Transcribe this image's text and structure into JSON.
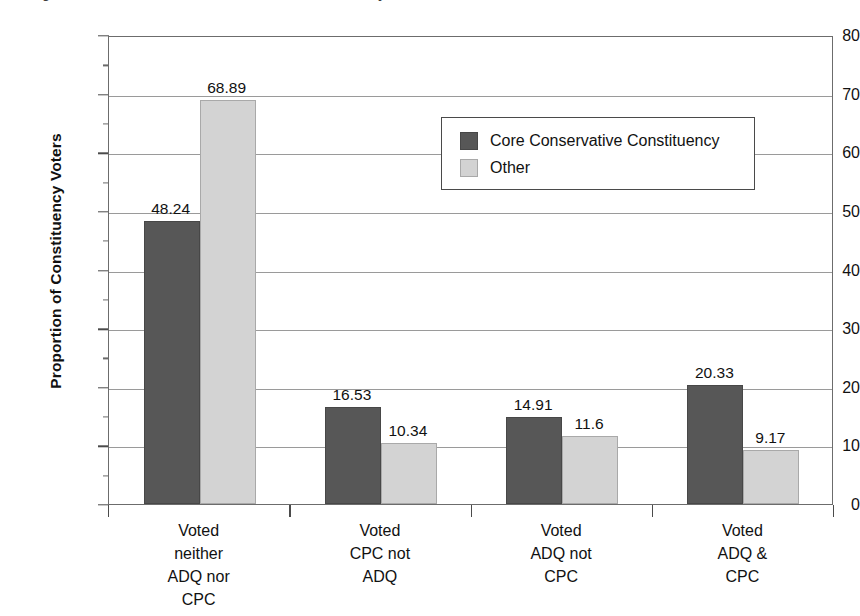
{
  "chart_data": {
    "type": "bar",
    "title": "",
    "xlabel": "",
    "ylabel": "Proportion of Constituency Voters",
    "ylim": [
      0,
      80
    ],
    "ytick_step": 10,
    "yticks": [
      0,
      10,
      20,
      30,
      40,
      50,
      60,
      70,
      80
    ],
    "grid": true,
    "legend_position": "inside-upper-right",
    "categories": [
      "Voted\nneither\nADQ nor\nCPC",
      "Voted\nCPC not\nADQ",
      "Voted\nADQ not\nCPC",
      "Voted\nADQ &\nCPC"
    ],
    "category_lines": [
      [
        "Voted",
        "neither",
        "ADQ nor",
        "CPC"
      ],
      [
        "Voted",
        "CPC not",
        "ADQ"
      ],
      [
        "Voted",
        "ADQ not",
        "CPC"
      ],
      [
        "Voted",
        "ADQ &",
        "CPC"
      ]
    ],
    "series": [
      {
        "name": "Core Conservative Constituency",
        "color": "#575757",
        "values": [
          48.24,
          16.53,
          14.91,
          20.33
        ],
        "labels": [
          "48.24",
          "16.53",
          "14.91",
          "20.33"
        ]
      },
      {
        "name": "Other",
        "color": "#d3d3d3",
        "values": [
          68.89,
          10.34,
          11.6,
          9.17
        ],
        "labels": [
          "68.89",
          "10.34",
          "11.6",
          "9.17"
        ]
      }
    ]
  },
  "axis": {
    "y_title": "Proportion of Constituency Voters",
    "tick_labels": [
      "80",
      "70",
      "60",
      "50",
      "40",
      "30",
      "20",
      "10",
      "0"
    ]
  },
  "legend": {
    "entries": [
      {
        "label": "Core Conservative Constituency",
        "swatch": "core"
      },
      {
        "label": "Other",
        "swatch": "other"
      }
    ]
  },
  "title_sliver": {
    "text": "Figure 3: Vote choice of core conservative constituency and others"
  }
}
